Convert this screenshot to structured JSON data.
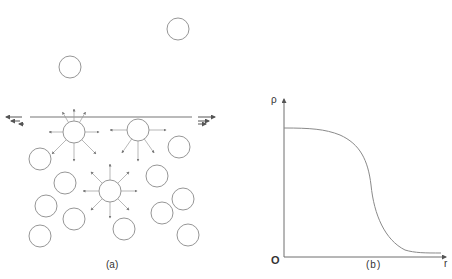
{
  "figure": {
    "panel_a": {
      "caption": "(a)",
      "description": "Molecules near a liquid surface; surface molecules experience net inward force, interior molecules balanced forces",
      "surface_line": {
        "x1": 30,
        "y1": 117,
        "x2": 192,
        "y2": 117
      },
      "surface_arrows": {
        "left": [
          {
            "x1": 22,
            "y1": 117,
            "x2": 6,
            "y2": 117
          },
          {
            "x1": 20,
            "y1": 121,
            "x2": 11,
            "y2": 121
          },
          {
            "x1": 24,
            "y1": 124,
            "x2": 19,
            "y2": 124
          }
        ],
        "right": [
          {
            "x1": 198,
            "y1": 117,
            "x2": 215,
            "y2": 117
          },
          {
            "x1": 198,
            "y1": 121,
            "x2": 209,
            "y2": 121
          },
          {
            "x1": 198,
            "y1": 124,
            "x2": 206,
            "y2": 124
          }
        ]
      },
      "vapor_molecules": [
        {
          "cx": 178,
          "cy": 29,
          "r": 11
        },
        {
          "cx": 70,
          "cy": 67,
          "r": 11
        }
      ],
      "force_molecules": [
        {
          "cx": 74,
          "cy": 132,
          "r": 11,
          "arrows": [
            [
              -90,
              12
            ],
            [
              -60,
              12
            ],
            [
              -120,
              12
            ],
            [
              0,
              14
            ],
            [
              180,
              14
            ],
            [
              45,
              20
            ],
            [
              90,
              18
            ],
            [
              135,
              20
            ]
          ]
        },
        {
          "cx": 138,
          "cy": 130,
          "r": 11,
          "arrows": [
            [
              0,
              17
            ],
            [
              180,
              17
            ],
            [
              90,
              20
            ],
            [
              55,
              17
            ],
            [
              125,
              17
            ]
          ]
        },
        {
          "cx": 110,
          "cy": 191,
          "r": 11,
          "arrows": [
            [
              0,
              16
            ],
            [
              180,
              16
            ],
            [
              90,
              16
            ],
            [
              -90,
              16
            ],
            [
              45,
              16
            ],
            [
              135,
              16
            ],
            [
              -45,
              16
            ],
            [
              -135,
              16
            ]
          ]
        }
      ],
      "liquid_molecules": [
        {
          "cx": 40,
          "cy": 159,
          "r": 11
        },
        {
          "cx": 179,
          "cy": 147,
          "r": 11
        },
        {
          "cx": 65,
          "cy": 183,
          "r": 11
        },
        {
          "cx": 157,
          "cy": 176,
          "r": 11
        },
        {
          "cx": 46,
          "cy": 206,
          "r": 11
        },
        {
          "cx": 183,
          "cy": 199,
          "r": 11
        },
        {
          "cx": 74,
          "cy": 219,
          "r": 11
        },
        {
          "cx": 162,
          "cy": 213,
          "r": 11
        },
        {
          "cx": 40,
          "cy": 236,
          "r": 11
        },
        {
          "cx": 124,
          "cy": 229,
          "r": 11
        },
        {
          "cx": 188,
          "cy": 235,
          "r": 11
        }
      ]
    },
    "panel_b": {
      "caption": "(b)",
      "y_axis_label": "ρ",
      "x_axis_label": "r",
      "origin_label": "O",
      "description": "Density profile across a liquid-vapor interface: flat high density, smooth sigmoidal drop to near-zero",
      "curve_path": "M 284 128 C 310 128, 325 129, 340 135 C 360 144, 368 160, 371 185 C 374 215, 385 240, 405 250 C 415 253, 425 253, 441 253"
    }
  },
  "colors": {
    "stroke": "#8a8a8a",
    "axis": "#6e6e6e",
    "text": "#333333"
  }
}
